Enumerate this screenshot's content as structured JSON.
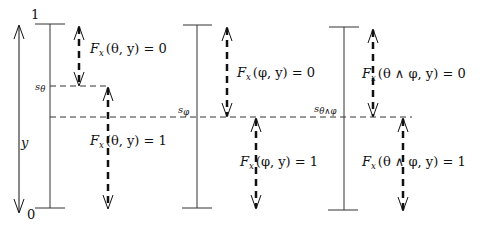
{
  "axis": {
    "top_label": "1",
    "bottom_label": "0",
    "variable_label": "y"
  },
  "thresholds": {
    "s_theta": {
      "label": "s",
      "subscript": "θ"
    },
    "s_phi": {
      "label": "s",
      "subscript": "φ"
    },
    "s_theta_and_phi": {
      "label": "s",
      "subscript": "θ∧φ"
    }
  },
  "panels": [
    {
      "formula": "θ",
      "upper_label": {
        "F": "F",
        "sub": "x",
        "arg": "(θ, y) = 0"
      },
      "lower_label": {
        "F": "F",
        "sub": "x",
        "arg": "(θ, y) = 1"
      }
    },
    {
      "formula": "φ",
      "upper_label": {
        "F": "F",
        "sub": "x",
        "arg": "(φ, y) = 0"
      },
      "lower_label": {
        "F": "F",
        "sub": "x",
        "arg": "(φ, y) = 1"
      }
    },
    {
      "formula": "θ ∧ φ",
      "upper_label": {
        "F": "F",
        "sub": "x",
        "arg": "(θ ∧ φ, y) = 0"
      },
      "lower_label": {
        "F": "F",
        "sub": "x",
        "arg": "(θ ∧ φ, y) = 1"
      }
    }
  ]
}
